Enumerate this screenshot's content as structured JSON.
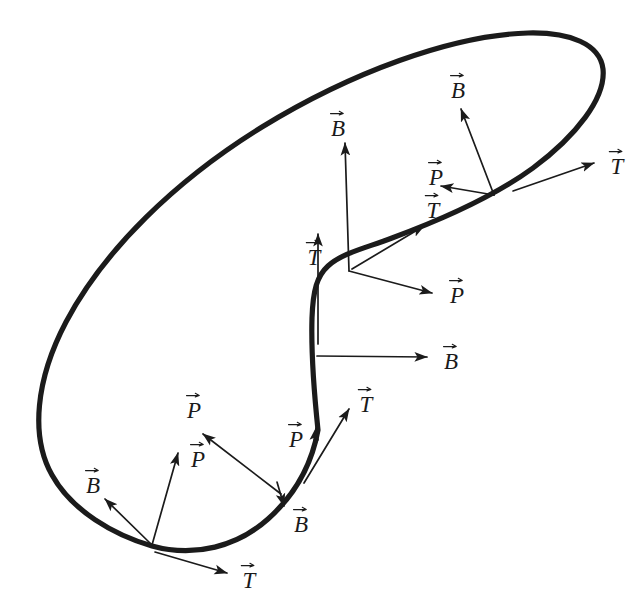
{
  "figure": {
    "kind": "frenet-frame-diagram",
    "background_color": "#ffffff",
    "ink_color": "#1b1b1b",
    "width": 637,
    "height": 610,
    "curve": {
      "name": "space-curve",
      "stroke_color": "#1b1b1b",
      "stroke_width": 5.2,
      "path": "M 318 430 C 314 392 311 352 312 318 C 313 290 317 276 328 266 C 342 253 366 248 392 238 C 438 221 492 198 533 168 C 576 136 606 98 603 69 C 600 44 570 32 528 33 C 452 35 350 73 262 127 C 176 180 104 250 66 322 C 36 379 30 436 52 475 C 72 511 114 535 152 546 C 195 558 238 546 268 519 C 296 494 312 463 318 430 Z"
    },
    "frames": [
      {
        "id": "frame-top-right",
        "anchor": [
          495,
          196
        ],
        "vectors": [
          {
            "symbol": "B",
            "name": "binormal",
            "tip": [
              460,
              108
            ],
            "label_at": [
              458,
              85
            ]
          },
          {
            "symbol": "P",
            "name": "principal-normal",
            "tip": [
              441,
              186
            ],
            "label_at": [
              436,
              172
            ]
          },
          {
            "symbol": "T",
            "name": "tangent",
            "tip": [
              423,
              212
            ],
            "label_at": [
              433,
              205
            ]
          }
        ]
      },
      {
        "id": "frame-right-end",
        "anchor": [
          513,
          190
        ],
        "vectors": [
          {
            "symbol": "T",
            "name": "tangent",
            "tip": [
              594,
              163
            ],
            "label_at": [
              617,
              161
            ]
          }
        ]
      },
      {
        "id": "frame-upper-middle",
        "anchor": [
          348,
          270
        ],
        "vectors": [
          {
            "symbol": "B",
            "name": "binormal",
            "tip": [
              345,
              142
            ],
            "label_at": [
              337,
              124
            ]
          },
          {
            "symbol": "T",
            "name": "tangent",
            "tip": [
              424,
              225
            ],
            "label_at": [
              434,
              205
            ]
          },
          {
            "symbol": "P",
            "name": "principal-normal",
            "tip": [
              432,
              293
            ],
            "label_at": [
              456,
              291
            ]
          }
        ]
      },
      {
        "id": "frame-vertical-upper",
        "anchor": [
          318,
          290
        ],
        "vectors": [
          {
            "symbol": "T",
            "name": "tangent",
            "tip": [
              318,
              233
            ],
            "label_at": [
              314,
              253
            ]
          }
        ]
      },
      {
        "id": "frame-vertical-middle",
        "anchor": [
          318,
          356
        ],
        "vectors": [
          {
            "symbol": "B",
            "name": "binormal",
            "tip": [
              427,
              357
            ],
            "label_at": [
              450,
              357
            ]
          }
        ]
      },
      {
        "id": "frame-lower-middle",
        "anchor": [
          305,
          482
        ],
        "vectors": [
          {
            "symbol": "T",
            "name": "tangent",
            "tip": [
              349,
              408
            ],
            "label_at": [
              366,
              399
            ]
          },
          {
            "symbol": "P",
            "name": "principal-normal",
            "tip": [
              316,
              427
            ],
            "label_at": [
              297,
              434
            ]
          },
          {
            "symbol": "B",
            "name": "binormal",
            "tip": [
              283,
              505
            ],
            "label_at": [
              300,
              519
            ]
          }
        ]
      },
      {
        "id": "frame-lower-left",
        "anchor": [
          152,
          544
        ],
        "vectors": [
          {
            "symbol": "B",
            "name": "binormal",
            "tip": [
              105,
              498
            ],
            "label_at": [
              93,
              480
            ]
          },
          {
            "symbol": "P",
            "name": "principal-normal",
            "tip": [
              178,
              452
            ],
            "label_at": [
              198,
              454
            ]
          },
          {
            "symbol": "T",
            "name": "tangent",
            "tip": [
              227,
              573
            ],
            "label_at": [
              249,
              575
            ]
          }
        ]
      },
      {
        "id": "frame-lower-left-long-normal",
        "anchor": [
          281,
          494
        ],
        "vectors": [
          {
            "symbol": "P",
            "name": "principal-normal",
            "tip": [
              203,
              434
            ],
            "label_at": [
              194,
              406
            ]
          }
        ]
      }
    ],
    "labels": [
      {
        "id": "lbl-b-top-right",
        "text": "B",
        "x": 458,
        "y": 86
      },
      {
        "id": "lbl-t-right-end",
        "text": "T",
        "x": 617,
        "y": 162
      },
      {
        "id": "lbl-p-top-right",
        "text": "P",
        "x": 436,
        "y": 173
      },
      {
        "id": "lbl-t-top-right",
        "text": "T",
        "x": 433,
        "y": 206
      },
      {
        "id": "lbl-b-upper-middle",
        "text": "B",
        "x": 338,
        "y": 124
      },
      {
        "id": "lbl-t-vertical-upper",
        "text": "T",
        "x": 314,
        "y": 253
      },
      {
        "id": "lbl-p-upper-middle",
        "text": "P",
        "x": 457,
        "y": 291
      },
      {
        "id": "lbl-b-vertical-middle",
        "text": "B",
        "x": 451,
        "y": 357
      },
      {
        "id": "lbl-t-lower-middle",
        "text": "T",
        "x": 366,
        "y": 400
      },
      {
        "id": "lbl-p-long-normal",
        "text": "P",
        "x": 194,
        "y": 406
      },
      {
        "id": "lbl-p-lower-left",
        "text": "P",
        "x": 198,
        "y": 455
      },
      {
        "id": "lbl-p-lower-middle",
        "text": "P",
        "x": 296,
        "y": 435
      },
      {
        "id": "lbl-b-lower-left",
        "text": "B",
        "x": 93,
        "y": 481
      },
      {
        "id": "lbl-b-lower-middle",
        "text": "B",
        "x": 301,
        "y": 520
      },
      {
        "id": "lbl-t-bottom",
        "text": "T",
        "x": 249,
        "y": 576
      }
    ],
    "arrows": [
      {
        "id": "arr-b-top-right",
        "symbol": "B",
        "x1": 494,
        "y1": 195,
        "x2": 461,
        "y2": 109
      },
      {
        "id": "arr-p-top-right",
        "symbol": "P",
        "x1": 494,
        "y1": 195,
        "x2": 441,
        "y2": 186
      },
      {
        "id": "arr-t-right-end",
        "symbol": "T",
        "x1": 513,
        "y1": 191,
        "x2": 594,
        "y2": 163
      },
      {
        "id": "arr-b-upper-middle",
        "symbol": "B",
        "x1": 349,
        "y1": 271,
        "x2": 345,
        "y2": 143
      },
      {
        "id": "arr-t-upper-middle",
        "symbol": "T",
        "x1": 352,
        "y1": 269,
        "x2": 424,
        "y2": 226
      },
      {
        "id": "arr-p-upper-middle",
        "symbol": "P",
        "x1": 349,
        "y1": 271,
        "x2": 432,
        "y2": 293
      },
      {
        "id": "arr-t-vertical-upper",
        "symbol": "T",
        "x1": 318,
        "y1": 344,
        "x2": 318,
        "y2": 234
      },
      {
        "id": "arr-b-vertical-middle",
        "symbol": "B",
        "x1": 317,
        "y1": 356,
        "x2": 427,
        "y2": 357
      },
      {
        "id": "arr-t-lower-middle",
        "symbol": "T",
        "x1": 304,
        "y1": 483,
        "x2": 349,
        "y2": 409
      },
      {
        "id": "arr-p-lower-middle",
        "symbol": "P",
        "x1": 313,
        "y1": 450,
        "x2": 316,
        "y2": 428
      },
      {
        "id": "arr-b-lower-middle",
        "symbol": "B",
        "x1": 277,
        "y1": 482,
        "x2": 284,
        "y2": 506
      },
      {
        "id": "arr-p-long-normal",
        "symbol": "P",
        "x1": 281,
        "y1": 494,
        "x2": 203,
        "y2": 434
      },
      {
        "id": "arr-b-lower-left",
        "symbol": "B",
        "x1": 152,
        "y1": 545,
        "x2": 105,
        "y2": 499
      },
      {
        "id": "arr-p-lower-left",
        "symbol": "P",
        "x1": 152,
        "y1": 545,
        "x2": 178,
        "y2": 453
      },
      {
        "id": "arr-t-bottom",
        "symbol": "T",
        "x1": 155,
        "y1": 552,
        "x2": 227,
        "y2": 573
      }
    ]
  }
}
